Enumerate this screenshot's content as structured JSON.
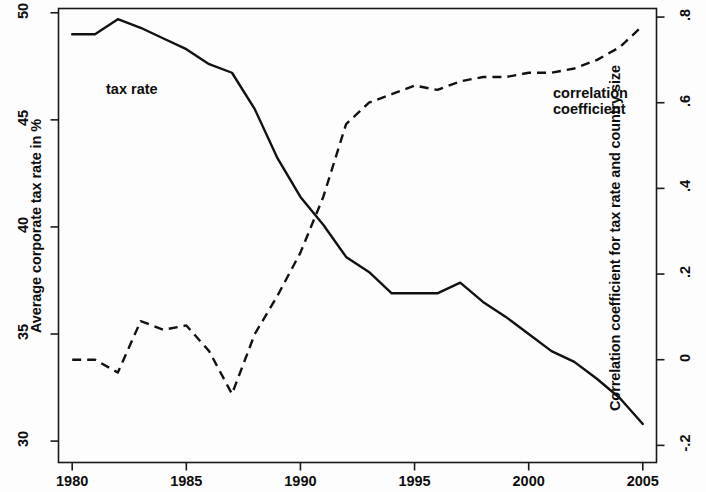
{
  "figure": {
    "background_color": "#fdfdfd",
    "line_color": "#111111"
  },
  "axes": {
    "left": {
      "title": "Average corporate tax rate in %",
      "ticks": [
        "30",
        "35",
        "40",
        "45",
        "50"
      ],
      "range": [
        29.0,
        50.2
      ]
    },
    "right": {
      "title": "Correlation coefficient for tax rate and country size",
      "ticks": [
        "-.2",
        "0",
        ".2",
        ".4",
        ".6",
        ".8"
      ],
      "range": [
        -0.24,
        0.82
      ]
    },
    "bottom": {
      "title": "",
      "ticks": [
        "1980",
        "1985",
        "1990",
        "1995",
        "2000",
        "2005"
      ],
      "range": [
        1979.4,
        2005.6
      ]
    }
  },
  "annotations": {
    "tax_rate_label": "tax rate",
    "correlation_label": "correlation\ncoefficient"
  },
  "chart_data": {
    "type": "line",
    "title": "",
    "xlabel": "",
    "ylabel": "Average corporate tax rate in %",
    "y2label": "Correlation coefficient for tax rate and country size",
    "xlim": [
      1979.4,
      2005.6
    ],
    "ylim": [
      29.0,
      50.2
    ],
    "y2lim": [
      -0.24,
      0.82
    ],
    "grid": false,
    "legend": "inline-annotations",
    "x": [
      1980,
      1981,
      1982,
      1983,
      1984,
      1985,
      1986,
      1987,
      1988,
      1989,
      1990,
      1991,
      1992,
      1993,
      1994,
      1995,
      1996,
      1997,
      1998,
      1999,
      2000,
      2001,
      2002,
      2003,
      2004,
      2005
    ],
    "series": [
      {
        "name": "tax rate",
        "axis": "left",
        "style": "solid",
        "values": [
          49.0,
          49.0,
          49.7,
          49.3,
          48.8,
          48.3,
          47.6,
          47.2,
          45.5,
          43.2,
          41.4,
          40.1,
          38.6,
          37.9,
          36.9,
          36.9,
          36.9,
          37.4,
          36.5,
          35.8,
          35.0,
          34.2,
          33.7,
          32.9,
          32.0,
          30.8
        ]
      },
      {
        "name": "correlation coefficient",
        "axis": "right",
        "style": "dashed",
        "values": [
          0.0,
          0.0,
          -0.03,
          0.09,
          0.07,
          0.08,
          0.02,
          -0.08,
          0.06,
          0.15,
          0.25,
          0.38,
          0.55,
          0.6,
          0.62,
          0.64,
          0.63,
          0.65,
          0.66,
          0.66,
          0.67,
          0.67,
          0.68,
          0.7,
          0.73,
          0.78
        ]
      }
    ]
  }
}
